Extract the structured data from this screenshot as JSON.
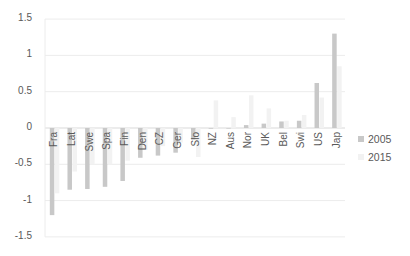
{
  "chart_data": {
    "type": "bar",
    "title": "",
    "xlabel": "",
    "ylabel": "",
    "ylim": [
      -1.5,
      1.5
    ],
    "yticks": [
      "1.5",
      "1",
      "0.5",
      "0",
      "-0.5",
      "-1",
      "-1.5"
    ],
    "grid": true,
    "legend_position": "right",
    "categories": [
      "Fra",
      "Lat",
      "Swe",
      "Spa",
      "Fin",
      "Den",
      "CZ",
      "Ger",
      "Slo",
      "NZ",
      "Aus",
      "Nor",
      "UK",
      "Bel",
      "Swi",
      "US",
      "Jap"
    ],
    "series": [
      {
        "name": "2005",
        "color": "#c8c8c8",
        "values": [
          -1.2,
          -0.85,
          -0.84,
          -0.81,
          -0.73,
          -0.41,
          -0.38,
          -0.34,
          -0.16,
          -0.01,
          0.0,
          0.04,
          0.06,
          0.09,
          0.1,
          0.62,
          1.3
        ]
      },
      {
        "name": "2015",
        "color": "#f2f2f2",
        "values": [
          -0.9,
          -0.6,
          -0.5,
          -0.5,
          -0.45,
          -0.3,
          -0.25,
          -0.2,
          -0.4,
          0.38,
          0.15,
          0.45,
          0.27,
          0.1,
          0.18,
          0.42,
          0.85
        ]
      }
    ]
  }
}
